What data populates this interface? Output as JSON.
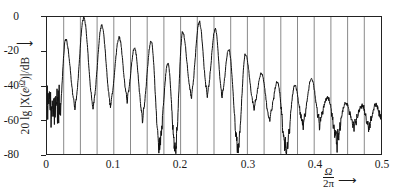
{
  "chart_data": {
    "type": "line",
    "title": "",
    "subtitle": "",
    "xlabel": "Ω/2π",
    "ylabel": "20 lg |X(e^{jΩ})|/dB",
    "ylabel_parts": {
      "prefix": "20 lg |X(",
      "e": "e",
      "exp": "jΩ",
      "suffix": ")|/dB",
      "arrow": "↑"
    },
    "xlim": [
      0,
      0.5
    ],
    "ylim": [
      -80,
      0
    ],
    "grid": true,
    "grid_axis": "x",
    "grid_step": 0.025,
    "legend": null,
    "xticks": [
      0,
      0.1,
      0.2,
      0.3,
      0.4,
      0.5
    ],
    "xtick_labels": [
      "0",
      "0.1",
      "0.2",
      "0.3",
      "0.4",
      "0.5"
    ],
    "yticks": [
      0,
      -20,
      -40,
      -60,
      -80
    ],
    "ytick_labels": [
      "0",
      "-20",
      "-40",
      "-60",
      "-80"
    ],
    "line_color": "#111111",
    "line_width": 1.0,
    "series": [
      {
        "name": "20 lg |X(e^{jΩ})|",
        "peaks": [
          {
            "x": 0.028,
            "y": -13
          },
          {
            "x": 0.055,
            "y": -0.5
          },
          {
            "x": 0.082,
            "y": -5
          },
          {
            "x": 0.108,
            "y": -12
          },
          {
            "x": 0.131,
            "y": -18
          },
          {
            "x": 0.156,
            "y": -14
          },
          {
            "x": 0.181,
            "y": -27
          },
          {
            "x": 0.203,
            "y": -9
          },
          {
            "x": 0.228,
            "y": -3
          },
          {
            "x": 0.252,
            "y": -7
          },
          {
            "x": 0.272,
            "y": -19
          },
          {
            "x": 0.297,
            "y": -22
          },
          {
            "x": 0.321,
            "y": -33
          },
          {
            "x": 0.345,
            "y": -38
          },
          {
            "x": 0.371,
            "y": -40
          },
          {
            "x": 0.396,
            "y": -36
          },
          {
            "x": 0.42,
            "y": -47
          },
          {
            "x": 0.447,
            "y": -50
          },
          {
            "x": 0.472,
            "y": -52
          },
          {
            "x": 0.492,
            "y": -51
          }
        ],
        "nulls": [
          {
            "x": 0.017,
            "y": -66
          },
          {
            "x": 0.042,
            "y": -50
          },
          {
            "x": 0.069,
            "y": -50
          },
          {
            "x": 0.095,
            "y": -49
          },
          {
            "x": 0.12,
            "y": -46
          },
          {
            "x": 0.143,
            "y": -56
          },
          {
            "x": 0.168,
            "y": -74
          },
          {
            "x": 0.192,
            "y": -76
          },
          {
            "x": 0.216,
            "y": -44
          },
          {
            "x": 0.24,
            "y": -43
          },
          {
            "x": 0.262,
            "y": -44
          },
          {
            "x": 0.286,
            "y": -75
          },
          {
            "x": 0.31,
            "y": -51
          },
          {
            "x": 0.333,
            "y": -58
          },
          {
            "x": 0.358,
            "y": -77
          },
          {
            "x": 0.383,
            "y": -61
          },
          {
            "x": 0.408,
            "y": -60
          },
          {
            "x": 0.434,
            "y": -70
          },
          {
            "x": 0.459,
            "y": -62
          },
          {
            "x": 0.482,
            "y": -63
          }
        ],
        "noise_floor_start_db": -52,
        "noise_floor_end_db": -60
      }
    ]
  },
  "axes": {
    "y_axis_ticks": [
      "0",
      "-20",
      "-40",
      "-60",
      "-80"
    ],
    "x_axis_ticks": [
      "0",
      "0.1",
      "0.2",
      "0.3",
      "0.4",
      "0.5"
    ]
  },
  "xaxis_label": {
    "numerator": "Ω",
    "denominator": "2π",
    "arrow": "⟶"
  }
}
